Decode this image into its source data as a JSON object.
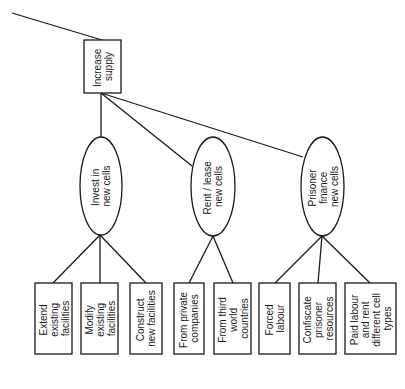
{
  "diagram": {
    "type": "tree",
    "orientation": "rotated-90-ccw",
    "root": {
      "label_lines": [
        "Increase",
        "supply"
      ]
    },
    "branches": [
      {
        "label_lines": [
          "Invest in",
          "new cells"
        ],
        "children": [
          {
            "label_lines": [
              "Extend",
              "existing",
              "facilities"
            ]
          },
          {
            "label_lines": [
              "Modify",
              "existing",
              "facilities"
            ]
          },
          {
            "label_lines": [
              "Construct",
              "new facilities"
            ]
          }
        ]
      },
      {
        "label_lines": [
          "Rent / lease",
          "new cells"
        ],
        "children": [
          {
            "label_lines": [
              "From private",
              "companies"
            ]
          },
          {
            "label_lines": [
              "From third",
              "world",
              "countries"
            ]
          }
        ]
      },
      {
        "label_lines": [
          "Prisoner",
          "finance",
          "new cells"
        ],
        "children": [
          {
            "label_lines": [
              "Forced",
              "labour"
            ]
          },
          {
            "label_lines": [
              "Confiscate",
              "prisoner",
              "resources"
            ]
          },
          {
            "label_lines": [
              "Paid labour",
              "and rent",
              "different cell",
              "types"
            ]
          }
        ]
      }
    ]
  }
}
